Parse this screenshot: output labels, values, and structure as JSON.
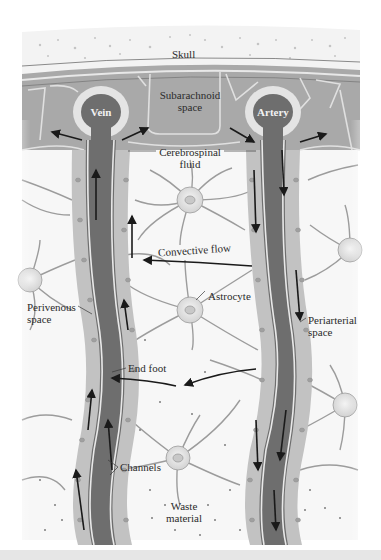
{
  "diagram": {
    "type": "anatomical-illustration",
    "color_scheme": "grayscale",
    "colors": {
      "background": "#ffffff",
      "skull": "#f2f2f2",
      "meninges": "#9a9a9a",
      "vessel": "#6e6e6e",
      "vessel_ring": "#e4e4e4",
      "perivascular": "#b8b8b8",
      "tissue": "#f7f7f7",
      "arrows": "#1a1a1a"
    },
    "labels": {
      "skull": "Skull",
      "subarachnoid_line1": "Subarachnoid",
      "subarachnoid_line2": "space",
      "vein": "Vein",
      "artery": "Artery",
      "csf_line1": "Cerebrospinal",
      "csf_line2": "fluid",
      "convective_flow": "Convective flow",
      "astrocyte": "Astrocyte",
      "perivenous_line1": "Perivenous",
      "perivenous_line2": "space",
      "periarterial_line1": "Periarterial",
      "periarterial_line2": "space",
      "end_foot": "End foot",
      "channels": "Channels",
      "waste_line1": "Waste",
      "waste_line2": "material"
    }
  }
}
